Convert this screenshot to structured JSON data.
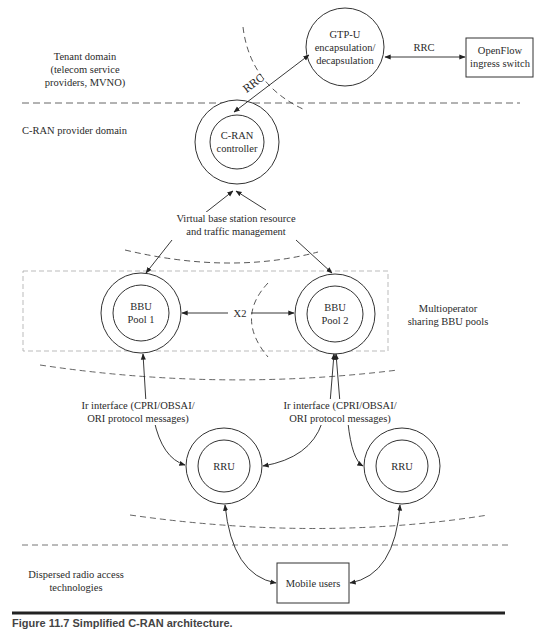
{
  "domains": {
    "tenant": [
      "Tenant domain",
      "(telecom service",
      "providers, MVNO)"
    ],
    "cran_provider": "C-RAN provider domain",
    "multioperator": [
      "Multioperator",
      "sharing BBU pools"
    ],
    "dispersed": [
      "Dispersed radio access",
      "technologies"
    ]
  },
  "nodes": {
    "gtpu": [
      "GTP-U",
      "encapsulation/",
      "decapsulation"
    ],
    "openflow": [
      "OpenFlow",
      "ingress switch"
    ],
    "cran_controller": [
      "C-RAN",
      "controller"
    ],
    "bbu1": [
      "BBU",
      "Pool 1"
    ],
    "bbu2": [
      "BBU",
      "Pool 2"
    ],
    "rru1": "RRU",
    "rru2": "RRU",
    "mobile_users": "Mobile users"
  },
  "links": {
    "rrc_gtpu_openflow": "RRC",
    "rrc_controller_gtpu": "RRC",
    "vbs": [
      "Virtual base station resource",
      "and traffic management"
    ],
    "x2": "X2",
    "ir_left": [
      "Ir interface (CPRI/OBSAI/",
      "ORI protocol messages)"
    ],
    "ir_right": [
      "Ir interface (CPRI/OBSAI/",
      "ORI protocol messages)"
    ]
  },
  "caption": "Figure 11.7  Simplified C-RAN architecture."
}
